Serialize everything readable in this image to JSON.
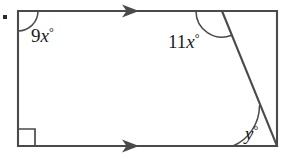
{
  "figure": {
    "type": "geometry-diagram",
    "background_color": "#ffffff",
    "stroke_color": "#4a4a4a",
    "label_color": "#1c1c1c",
    "bullet": {
      "name": "item-bullet",
      "x": 5,
      "y": 17,
      "size": 4
    },
    "rectangle": {
      "left": 18,
      "top": 11,
      "right": 277,
      "bottom": 146
    },
    "diagonal": {
      "x1": 222,
      "y1": 11,
      "x2": 277,
      "y2": 146
    },
    "right_angle_marker": {
      "name": "right-angle-square",
      "corner": "bottom-left",
      "size": 17
    },
    "parallel_arrows": [
      {
        "name": "top-edge-arrow",
        "edge": "top",
        "x": 130,
        "y": 11,
        "direction": "right"
      },
      {
        "name": "bottom-edge-arrow",
        "edge": "bottom",
        "x": 130,
        "y": 146,
        "direction": "right"
      }
    ],
    "angles": [
      {
        "name": "angle-9x",
        "vertex": "top-left",
        "coefficient": "9",
        "variable": "x",
        "unit": "°",
        "label_x": 31,
        "label_y": 42,
        "arc_radius": 20
      },
      {
        "name": "angle-11x",
        "vertex": "top-right-interior",
        "coefficient": "11",
        "variable": "x",
        "unit": "°",
        "label_x": 168,
        "label_y": 48,
        "arc_radius": 26
      },
      {
        "name": "angle-y",
        "vertex": "bottom-right",
        "coefficient": "",
        "variable": "y",
        "unit": "°",
        "label_x": 245,
        "label_y": 140,
        "arc_radius": 44
      }
    ]
  }
}
